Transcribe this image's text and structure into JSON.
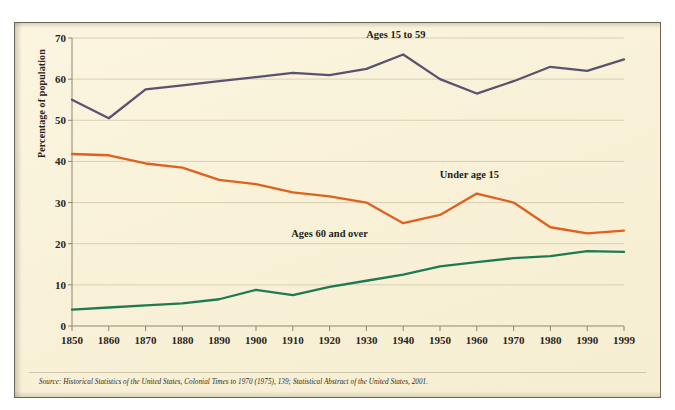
{
  "figure": {
    "background_color": "#faf3dc",
    "source_note": "Source: Historical Statistics of the United States, Colonial Times to 1970 (1975), 139; Statistical Abstract of the United States, 2001."
  },
  "chart_data": {
    "type": "line",
    "title": "",
    "xlabel": "",
    "ylabel": "Percentage of population",
    "categories": [
      "1850",
      "1860",
      "1870",
      "1880",
      "1890",
      "1900",
      "1910",
      "1920",
      "1930",
      "1940",
      "1950",
      "1960",
      "1970",
      "1980",
      "1990",
      "1999"
    ],
    "x": [
      1850,
      1860,
      1870,
      1880,
      1890,
      1900,
      1910,
      1920,
      1930,
      1940,
      1950,
      1960,
      1970,
      1980,
      1990,
      1999
    ],
    "xlim": [
      1850,
      1999
    ],
    "ylim": [
      0,
      70
    ],
    "yticks": [
      0,
      10,
      20,
      30,
      40,
      50,
      60,
      70
    ],
    "grid": "horizontal",
    "legend": "inline-annotations",
    "series": [
      {
        "name": "Ages 15 to 59",
        "color": "#5a5370",
        "values": [
          55.0,
          50.5,
          57.5,
          58.5,
          59.5,
          60.5,
          61.5,
          61.0,
          62.5,
          66.0,
          60.0,
          56.5,
          59.5,
          63.0,
          62.0,
          64.8
        ],
        "label_x": 1938,
        "label_y": 70.5
      },
      {
        "name": "Under age 15",
        "color": "#e0601f",
        "values": [
          41.8,
          41.5,
          39.5,
          38.5,
          35.5,
          34.5,
          32.5,
          31.5,
          30.0,
          25.0,
          27.0,
          32.2,
          30.0,
          24.0,
          22.5,
          23.2
        ],
        "label_x": 1958,
        "label_y": 36.5
      },
      {
        "name": "Ages 60 and over",
        "color": "#1f7a52",
        "values": [
          4.0,
          4.5,
          5.0,
          5.5,
          6.5,
          8.8,
          7.5,
          9.5,
          11.0,
          12.5,
          14.5,
          15.5,
          16.5,
          17.0,
          18.2,
          18.0
        ],
        "label_x": 1920,
        "label_y": 22.0
      }
    ]
  }
}
